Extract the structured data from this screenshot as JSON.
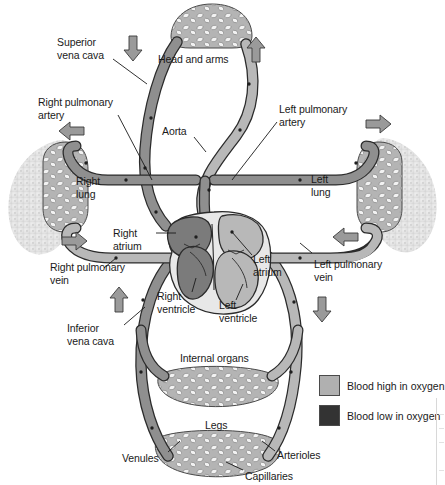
{
  "diagram": {
    "labels": [
      {
        "id": "superior-vena-cava",
        "text": "Superior\nvena cava",
        "x": 57,
        "y": 36,
        "align": "left"
      },
      {
        "id": "head-and-arms",
        "text": "Head and arms",
        "x": 158,
        "y": 53,
        "align": "left"
      },
      {
        "id": "right-pulmonary-artery",
        "text": "Right pulmonary\nartery",
        "x": 38,
        "y": 96,
        "align": "left"
      },
      {
        "id": "left-pulmonary-artery",
        "text": "Left pulmonary\nartery",
        "x": 279,
        "y": 103,
        "align": "left"
      },
      {
        "id": "aorta",
        "text": "Aorta",
        "x": 162,
        "y": 125,
        "align": "left"
      },
      {
        "id": "right-lung",
        "text": "Right\nlung",
        "x": 76,
        "y": 175,
        "align": "left"
      },
      {
        "id": "left-lung",
        "text": "Left\nlung",
        "x": 311,
        "y": 173,
        "align": "left"
      },
      {
        "id": "right-atrium",
        "text": "Right\natrium",
        "x": 113,
        "y": 227,
        "align": "left"
      },
      {
        "id": "left-atrium",
        "text": "Left\natrium",
        "x": 253,
        "y": 253,
        "align": "left"
      },
      {
        "id": "right-pulmonary-vein",
        "text": "Right pulmonary\nvein",
        "x": 50,
        "y": 261,
        "align": "left"
      },
      {
        "id": "left-pulmonary-vein",
        "text": "Left pulmonary\nvein",
        "x": 314,
        "y": 258,
        "align": "left"
      },
      {
        "id": "right-ventricle",
        "text": "Right\nventricle",
        "x": 157,
        "y": 290,
        "align": "left"
      },
      {
        "id": "left-ventricle",
        "text": "Left\nventricle",
        "x": 219,
        "y": 299,
        "align": "left"
      },
      {
        "id": "inferior-vena-cava",
        "text": "Inferior\nvena cava",
        "x": 67,
        "y": 322,
        "align": "left"
      },
      {
        "id": "internal-organs",
        "text": "Internal organs",
        "x": 180,
        "y": 352,
        "align": "left"
      },
      {
        "id": "legs",
        "text": "Legs",
        "x": 205,
        "y": 419,
        "align": "left"
      },
      {
        "id": "venules",
        "text": "Venules",
        "x": 122,
        "y": 452,
        "align": "left"
      },
      {
        "id": "arterioles",
        "text": "Arterioles",
        "x": 277,
        "y": 449,
        "align": "left"
      },
      {
        "id": "capillaries",
        "text": "Capillaries",
        "x": 245,
        "y": 470,
        "align": "left"
      }
    ]
  },
  "legend": {
    "items": [
      {
        "id": "blood-high-oxygen",
        "label": "Blood high in oxygen",
        "color": "#b0b0b0"
      },
      {
        "id": "blood-low-oxygen",
        "label": "Blood low in oxygen",
        "color": "#333333"
      }
    ]
  },
  "colors": {
    "oxygenated_vessel": "#b8b8b8",
    "deoxygenated_vessel": "#8f8f8f",
    "vessel_outline": "#2b2b2b",
    "lung_tissue": "#e3e3e3",
    "heart_outline": "#2b2b2b",
    "heart_chamber_light": "#e8e8e8",
    "arrow_fill": "#9a9a9a",
    "arrow_stroke": "#3a3a3a",
    "capillary_bed": "#b4b4b4",
    "label_text": "#1a1a1a",
    "background": "#ffffff"
  },
  "flow_arrows": [
    {
      "id": "arrow-svc-down",
      "direction": "down",
      "x": 133,
      "y": 44
    },
    {
      "id": "arrow-head-return-up",
      "direction": "up",
      "x": 256,
      "y": 52
    },
    {
      "id": "arrow-right-pa-left",
      "direction": "left",
      "x": 69,
      "y": 131
    },
    {
      "id": "arrow-left-pa-right",
      "direction": "right",
      "x": 378,
      "y": 124
    },
    {
      "id": "arrow-right-pv-right",
      "direction": "right",
      "x": 74,
      "y": 241
    },
    {
      "id": "arrow-left-pv-left",
      "direction": "left",
      "x": 345,
      "y": 237
    },
    {
      "id": "arrow-ivc-up",
      "direction": "up",
      "x": 119,
      "y": 300
    },
    {
      "id": "arrow-aorta-down",
      "direction": "down",
      "x": 322,
      "y": 305
    }
  ]
}
